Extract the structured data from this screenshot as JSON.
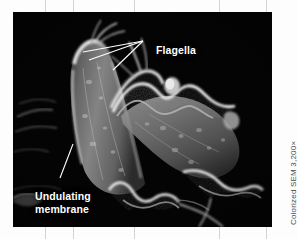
{
  "figure": {
    "type": "scanned-textbook-figure",
    "medium": "Colorized scanning electron micrograph",
    "plate": {
      "background_color": "#040404",
      "specimen_description": "Two elongated flagellated protozoan cells with rippled undulating membranes and slender flagella",
      "cell_tone_light": "#d8d8d8",
      "cell_tone_mid": "#8a8a8a",
      "cell_tone_dark": "#3a3a3a"
    },
    "labels": [
      {
        "id": "flagella",
        "text": "Flagella",
        "color": "#ffffff",
        "leader_count": 3
      },
      {
        "id": "undulating-membrane",
        "line1": "Undulating",
        "line2": "membrane",
        "color": "#ffffff",
        "leader_count": 1
      }
    ],
    "credit": {
      "text": "Colorized SEM 3,200×",
      "color": "#4b4b4d"
    },
    "page_background": "#fdfdfd",
    "guide_line_color": "#787880"
  }
}
